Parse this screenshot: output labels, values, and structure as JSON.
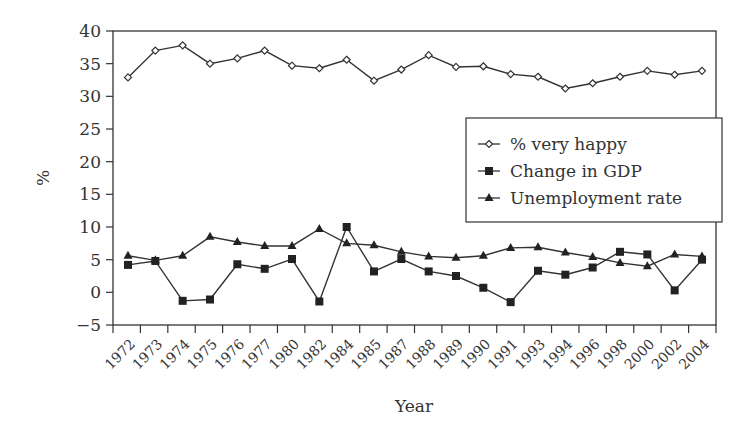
{
  "chart_data": {
    "type": "line",
    "title": "",
    "xlabel": "Year",
    "ylabel": "%",
    "ylim": [
      -5,
      40
    ],
    "yticks": [
      -5,
      0,
      5,
      10,
      15,
      20,
      25,
      30,
      35,
      40
    ],
    "grid": false,
    "legend_position": "inside-right-middle",
    "categories": [
      "1972",
      "1973",
      "1974",
      "1975",
      "1976",
      "1977",
      "1980",
      "1982",
      "1984",
      "1985",
      "1987",
      "1988",
      "1989",
      "1990",
      "1991",
      "1993",
      "1994",
      "1996",
      "1998",
      "2000",
      "2002",
      "2004"
    ],
    "series": [
      {
        "name": "% very happy",
        "marker": "open-diamond",
        "values": [
          32.9,
          37.0,
          37.8,
          35.0,
          35.8,
          37.0,
          34.7,
          34.3,
          35.6,
          32.4,
          34.1,
          36.3,
          34.5,
          34.6,
          33.4,
          33.0,
          31.2,
          32.0,
          33.0,
          33.9,
          33.3,
          33.9
        ]
      },
      {
        "name": "Change in GDP",
        "marker": "filled-square",
        "values": [
          4.2,
          4.8,
          -1.3,
          -1.1,
          4.3,
          3.6,
          5.1,
          -1.4,
          10.0,
          3.2,
          5.1,
          3.2,
          2.5,
          0.7,
          -1.5,
          3.3,
          2.7,
          3.8,
          6.2,
          5.8,
          0.3,
          5.0
        ]
      },
      {
        "name": "Unemployment rate",
        "marker": "filled-triangle",
        "values": [
          5.6,
          4.9,
          5.6,
          8.5,
          7.7,
          7.1,
          7.1,
          9.7,
          7.5,
          7.2,
          6.2,
          5.5,
          5.3,
          5.6,
          6.8,
          6.9,
          6.1,
          5.4,
          4.5,
          4.0,
          5.8,
          5.5
        ]
      }
    ]
  }
}
